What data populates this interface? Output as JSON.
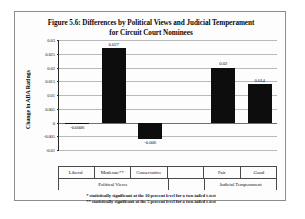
{
  "figure": {
    "title_line1": "Figure 5.6: Differences by Political Views and Judicial Temperament",
    "title_line2": "for Circuit Court Nominees"
  },
  "footnotes": {
    "one_star": "* statistically significant at the 10 percent level for a two-tailed t-test",
    "two_star": "** statistically significant at the 5 percent level for a two-tailed t-test"
  },
  "groups": {
    "political_views": "Political Views",
    "judicial_temperament": "Judicial Temperament"
  },
  "colors": {
    "bar": "#0d0d0d",
    "gridline": "#b9b9b9",
    "axis": "#2a2a2a",
    "frame": "#8d8d8d",
    "background": "#fdfdfd"
  },
  "chart_data": {
    "type": "bar",
    "title": "Figure 5.6: Differences by Political Views and Judicial Temperament for Circuit Court Nominees",
    "xlabel": "",
    "ylabel": "Change in ABA Ratings",
    "ylim": [
      -0.01,
      0.03
    ],
    "grid": true,
    "legend": "none",
    "yticks": [
      0.03,
      0.025,
      0.02,
      0.015,
      0.01,
      0.005,
      0,
      -0.005,
      -0.01
    ],
    "ytick_labels": [
      "0.03",
      "0.025",
      "0.02",
      "0.015",
      "0.01",
      "0.005",
      "0",
      "-0.005",
      "-0.01"
    ],
    "categories": [
      "Liberal",
      "Moderate**",
      "Conservative",
      "",
      "Fair",
      "Good"
    ],
    "values": [
      -0.0006,
      0.027,
      -0.006,
      null,
      0.02,
      0.014
    ],
    "value_labels": [
      "-0.0006",
      "0.027",
      "-0.006",
      "",
      "0.02",
      "0.014"
    ],
    "group_labels": [
      "Political Views",
      "Political Views",
      "Political Views",
      "",
      "Judicial Temperament",
      "Judicial Temperament"
    ],
    "annotations": [
      "* statistically significant at the 10 percent level for a two-tailed t-test",
      "** statistically significant at the 5 percent level for a two-tailed t-test"
    ]
  }
}
